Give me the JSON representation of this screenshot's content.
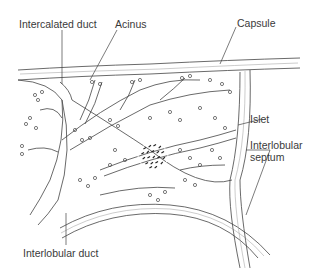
{
  "figure": {
    "labels": {
      "intercalated_duct": "Intercalated duct",
      "acinus": "Acinus",
      "capsule": "Capsule",
      "islet": "Islet",
      "interlobular_septum_line1": "Interlobular",
      "interlobular_septum_line2": "septum",
      "interlobular_duct": "Interlobular duct"
    }
  }
}
